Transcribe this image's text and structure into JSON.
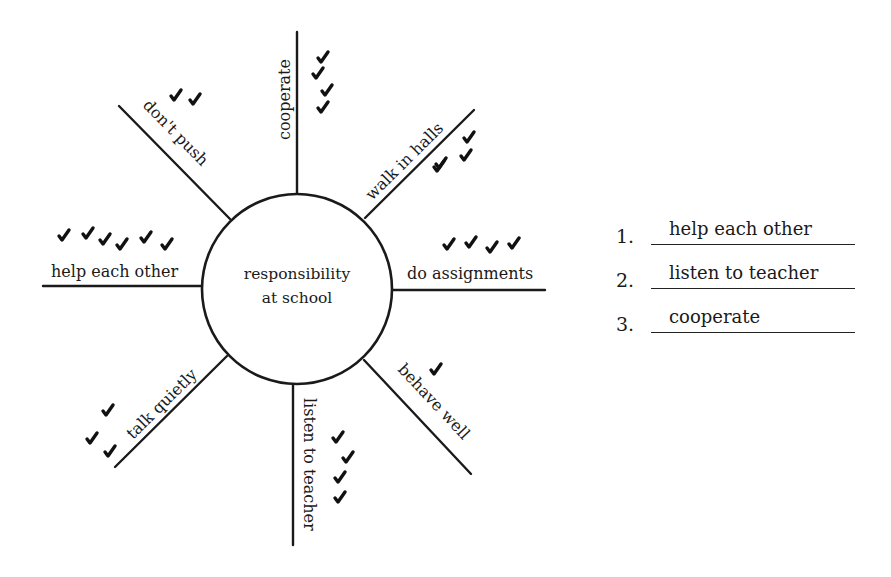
{
  "diagram": {
    "center_label_line1": "responsibility",
    "center_label_line2": "at school",
    "spokes": [
      {
        "label": "cooperate",
        "checks": 4
      },
      {
        "label": "walk in halls",
        "checks": 4
      },
      {
        "label": "do assignments",
        "checks": 4
      },
      {
        "label": "behave well",
        "checks": 1
      },
      {
        "label": "listen to teacher",
        "checks": 4
      },
      {
        "label": "talk quietly",
        "checks": 3
      },
      {
        "label": "help each other",
        "checks": 6
      },
      {
        "label": "don't push",
        "checks": 2
      }
    ]
  },
  "ranking": {
    "items": [
      {
        "number": "1.",
        "answer": "help each other"
      },
      {
        "number": "2.",
        "answer": "listen to teacher"
      },
      {
        "number": "3.",
        "answer": "cooperate"
      }
    ]
  }
}
